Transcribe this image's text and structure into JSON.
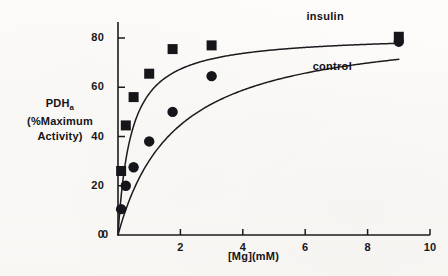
{
  "figure": {
    "y_axis_title_line1": "PDH",
    "y_axis_title_sub": "a",
    "y_axis_title_line2_open": "(",
    "y_axis_title_line2": "%Maximum",
    "y_axis_title_line3": "Activity",
    "y_axis_title_close": ")",
    "x_axis_title_main": "[Mg](mM)"
  },
  "chart_data": {
    "type": "scatter",
    "title": "",
    "xlabel": "[Mg](mM)",
    "ylabel": "PDHa (%Maximum Activity)",
    "xlim": [
      0,
      10
    ],
    "ylim": [
      0,
      88
    ],
    "xticks": [
      0,
      2,
      4,
      6,
      8,
      10
    ],
    "xtick_labels": [
      "0",
      "2",
      "4",
      "6",
      "8",
      "10"
    ],
    "yticks": [
      0,
      20,
      40,
      60,
      80
    ],
    "ytick_labels": [
      "0",
      "20",
      "40",
      "60",
      "80"
    ],
    "grid": false,
    "legend_position": "inline-curve-labels",
    "series": [
      {
        "name": "insulin",
        "marker": "square",
        "color": "#161519",
        "label_x": 7.0,
        "label_y": 88.0,
        "points": [
          {
            "x": 0.1,
            "y": 26.0
          },
          {
            "x": 0.25,
            "y": 44.5
          },
          {
            "x": 0.5,
            "y": 56.0
          },
          {
            "x": 1.0,
            "y": 65.5
          },
          {
            "x": 1.75,
            "y": 75.5
          },
          {
            "x": 3.0,
            "y": 77.0
          },
          {
            "x": 9.0,
            "y": 80.5
          }
        ],
        "curve_model": "michaelis-menten",
        "vmax": 81.5,
        "km": 0.42
      },
      {
        "name": "control",
        "marker": "circle",
        "color": "#161519",
        "label_x": 7.2,
        "label_y": 68.0,
        "points": [
          {
            "x": 0.1,
            "y": 10.5
          },
          {
            "x": 0.25,
            "y": 20.0
          },
          {
            "x": 0.5,
            "y": 27.5
          },
          {
            "x": 1.0,
            "y": 38.0
          },
          {
            "x": 1.75,
            "y": 50.0
          },
          {
            "x": 3.0,
            "y": 64.5
          },
          {
            "x": 9.0,
            "y": 78.5
          }
        ],
        "curve_model": "michaelis-menten",
        "vmax": 86.0,
        "km": 1.85
      }
    ],
    "annotations": [
      {
        "text": "insulin",
        "x": 7.0,
        "y": 88.0
      },
      {
        "text": "control",
        "x": 7.2,
        "y": 68.0
      }
    ]
  }
}
